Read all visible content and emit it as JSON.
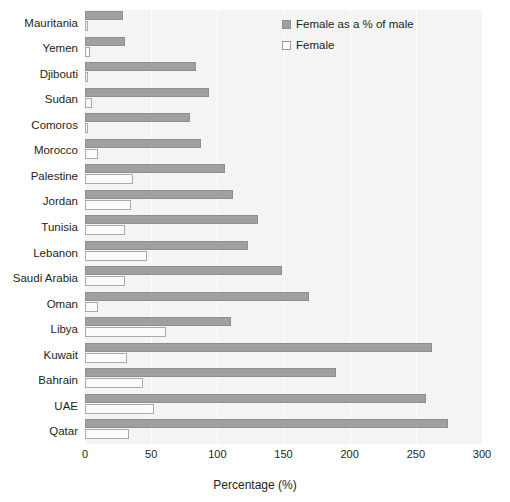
{
  "chart_data": {
    "type": "bar",
    "orientation": "horizontal",
    "title": "",
    "xlabel": "Percentage (%)",
    "ylabel": "",
    "xlim": [
      0,
      300
    ],
    "xticks": [
      0,
      50,
      100,
      150,
      200,
      250,
      300
    ],
    "grid": true,
    "legend_position": "top-right",
    "categories": [
      "Mauritania",
      "Yemen",
      "Djibouti",
      "Sudan",
      "Comoros",
      "Morocco",
      "Palestine",
      "Jordan",
      "Tunisia",
      "Lebanon",
      "Saudi Arabia",
      "Oman",
      "Libya",
      "Kuwait",
      "Bahrain",
      "UAE",
      "Qatar"
    ],
    "series": [
      {
        "name": "Female as a % of male",
        "color": "#a0a0a0",
        "values": [
          29,
          30,
          84,
          94,
          79,
          88,
          106,
          112,
          131,
          123,
          149,
          169,
          110,
          262,
          190,
          258,
          274
        ]
      },
      {
        "name": "Female",
        "color": "#ffffff",
        "values": [
          2,
          4,
          2,
          5,
          2,
          10,
          36,
          35,
          30,
          47,
          30,
          10,
          61,
          32,
          44,
          52,
          33
        ]
      }
    ]
  },
  "axis": {
    "x_title": "Percentage (%)",
    "tick_labels": [
      "0",
      "50",
      "100",
      "150",
      "200",
      "250",
      "300"
    ]
  },
  "legend": {
    "items": [
      {
        "label": "Female as a % of male",
        "swatch": "gray-square-swatch"
      },
      {
        "label": "Female",
        "swatch": "white-square-swatch"
      }
    ]
  }
}
